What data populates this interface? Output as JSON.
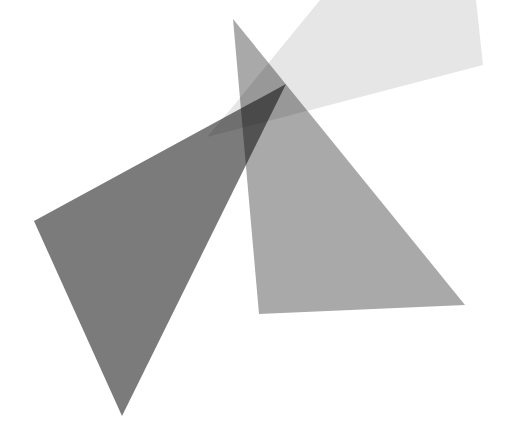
{
  "canvas": {
    "width": 519,
    "height": 432,
    "background": "#ffffff"
  },
  "shapes": [
    {
      "name": "light-quadrilateral",
      "points": "320,0 476,0 483,65 207,137 230,110",
      "fill": "#e6e6e6"
    },
    {
      "name": "medium-triangle",
      "points": "233,19 465,305 259,314",
      "fill": "#a9a9a9"
    },
    {
      "name": "dark-triangle",
      "points": "34,221 286,84 122,416",
      "fill": "#7b7b7b"
    }
  ]
}
